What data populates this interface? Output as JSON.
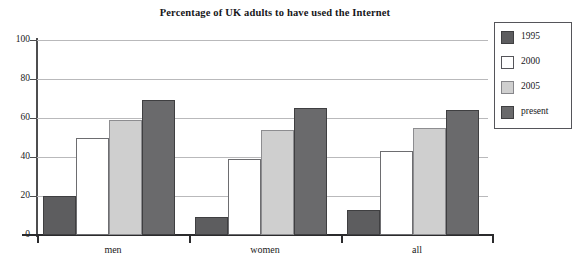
{
  "chart_data": {
    "type": "bar",
    "title": "Percentage of UK adults to have used the Internet",
    "xlabel": "",
    "ylabel": "",
    "ylim": [
      0,
      100
    ],
    "yticks": [
      0,
      20,
      40,
      60,
      80,
      100
    ],
    "ytick_labels": [
      "0",
      "20",
      "40",
      "60",
      "80",
      "100"
    ],
    "grid": true,
    "legend_position": "right-outside",
    "categories": [
      "men",
      "women",
      "all"
    ],
    "series": [
      {
        "name": "1995",
        "color": "#5d5d5f",
        "values": [
          20,
          9,
          13
        ]
      },
      {
        "name": "2000",
        "color": "#ffffff",
        "values": [
          50,
          39,
          43
        ]
      },
      {
        "name": "2005",
        "color": "#cfcfcf",
        "values": [
          59,
          54,
          55
        ]
      },
      {
        "name": "present",
        "color": "#6a6a6c",
        "values": [
          69,
          65,
          64
        ]
      }
    ]
  },
  "legend": {
    "entries": [
      {
        "label": "1995"
      },
      {
        "label": "2000"
      },
      {
        "label": "2005"
      },
      {
        "label": "present"
      }
    ]
  },
  "axes": {
    "y_tick_labels": [
      "100",
      "80",
      "60",
      "40",
      "20",
      "0"
    ],
    "x_tick_labels": [
      "men",
      "women",
      "all"
    ]
  }
}
